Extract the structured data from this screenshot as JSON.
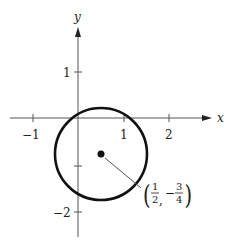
{
  "diagram": {
    "type": "circle-on-cartesian-plane",
    "axes": {
      "x_label": "x",
      "y_label": "y",
      "x_ticks": [
        {
          "value": -1,
          "label": "−1"
        },
        {
          "value": 1,
          "label": "1"
        },
        {
          "value": 2,
          "label": "2"
        }
      ],
      "y_ticks": [
        {
          "value": 1,
          "label": "1"
        },
        {
          "value": -1,
          "label": ""
        },
        {
          "value": -2,
          "label": "−2"
        }
      ]
    },
    "circle": {
      "center": [
        0.5,
        -0.75
      ],
      "radius": 1,
      "stroke_color": "#111111"
    },
    "center_point": {
      "label_left_paren": "(",
      "label_x_num": "1",
      "label_x_den": "2",
      "label_sep": ",",
      "label_minus": "−",
      "label_y_num": "3",
      "label_y_den": "4",
      "label_right_paren": ")"
    }
  }
}
